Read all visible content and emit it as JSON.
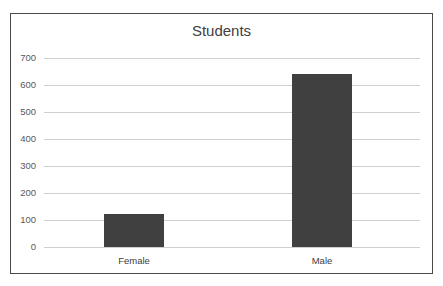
{
  "chart_data": {
    "type": "bar",
    "title": "Students",
    "categories": [
      "Female",
      "Male"
    ],
    "values": [
      122,
      640
    ],
    "xlabel": "",
    "ylabel": "",
    "ylim": [
      0,
      700
    ],
    "yticks": [
      "0",
      "100",
      "200",
      "300",
      "400",
      "500",
      "600",
      "700"
    ],
    "grid": true,
    "legend": "none",
    "bar_color": "#404040"
  }
}
